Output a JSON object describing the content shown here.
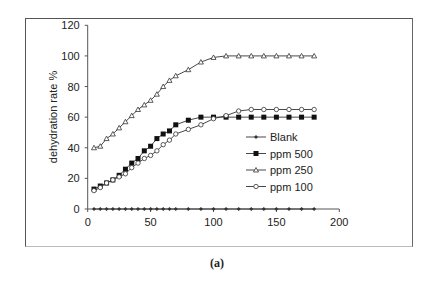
{
  "chart_data": {
    "type": "line",
    "title": "",
    "xlabel": "",
    "ylabel": "dehydration rate %",
    "xlim": [
      0,
      200
    ],
    "ylim": [
      0,
      120
    ],
    "xticks": [
      0,
      50,
      100,
      150,
      200
    ],
    "yticks": [
      0,
      20,
      40,
      60,
      80,
      100,
      120
    ],
    "grid": false,
    "legend_position": "inside-right",
    "x": [
      5,
      10,
      15,
      20,
      25,
      30,
      35,
      40,
      45,
      50,
      55,
      60,
      65,
      70,
      80,
      90,
      100,
      110,
      120,
      130,
      140,
      150,
      160,
      170,
      180
    ],
    "series": [
      {
        "name": "Blank",
        "marker": "diamond",
        "values": [
          0,
          0,
          0,
          0,
          0,
          0,
          0,
          0,
          0,
          0,
          0,
          0,
          0,
          0,
          0,
          0,
          0,
          0,
          0,
          0,
          0,
          0,
          0,
          0,
          0
        ]
      },
      {
        "name": "ppm 500",
        "marker": "square",
        "values": [
          13,
          15,
          17,
          19,
          22,
          26,
          30,
          33,
          38,
          41,
          46,
          49,
          51,
          55,
          58,
          60,
          60,
          60,
          60,
          60,
          60,
          60,
          60,
          60,
          60
        ]
      },
      {
        "name": "ppm 250",
        "marker": "triangle",
        "values": [
          40,
          41,
          46,
          49,
          53,
          57,
          61,
          65,
          68,
          71,
          75,
          80,
          84,
          87,
          91,
          96,
          99,
          100,
          100,
          100,
          100,
          100,
          100,
          100,
          100
        ]
      },
      {
        "name": "ppm 100",
        "marker": "circle",
        "values": [
          12,
          14,
          17,
          19,
          21,
          23,
          27,
          30,
          33,
          35,
          38,
          42,
          45,
          49,
          52,
          55,
          59,
          61,
          64,
          65,
          65,
          65,
          65,
          65,
          65
        ]
      }
    ]
  },
  "caption": "(a)",
  "colors": {
    "line": "#333333",
    "axis": "#555555",
    "frame": "#555555"
  }
}
